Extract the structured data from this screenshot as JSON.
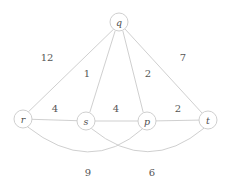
{
  "figure": {
    "kind": "weighted-undirected-graph",
    "background_color": "#ffffff",
    "edge_color": "#c9c9c9",
    "node_fill": "#ffffff",
    "node_stroke": "#c9c9c9",
    "label_color": "#4d4d4d"
  },
  "nodes": [
    {
      "id": "q",
      "label": "q",
      "x": 119,
      "y": 22,
      "r": 9
    },
    {
      "id": "r",
      "label": "r",
      "x": 23,
      "y": 119,
      "r": 9
    },
    {
      "id": "s",
      "label": "s",
      "x": 86,
      "y": 121,
      "r": 9
    },
    {
      "id": "p",
      "label": "p",
      "x": 147,
      "y": 121,
      "r": 9
    },
    {
      "id": "t",
      "label": "t",
      "x": 208,
      "y": 120,
      "r": 9
    }
  ],
  "edges": [
    {
      "id": "q-r",
      "from": "q",
      "to": "r",
      "weight": "12",
      "shape": "straight",
      "label_x": 47,
      "label_y": 57
    },
    {
      "id": "q-s",
      "from": "q",
      "to": "s",
      "weight": "1",
      "shape": "straight",
      "label_x": 87,
      "label_y": 73
    },
    {
      "id": "q-p",
      "from": "q",
      "to": "p",
      "weight": "2",
      "shape": "straight",
      "label_x": 148,
      "label_y": 73
    },
    {
      "id": "q-t",
      "from": "q",
      "to": "t",
      "weight": "7",
      "shape": "straight",
      "label_x": 183,
      "label_y": 57
    },
    {
      "id": "r-s",
      "from": "r",
      "to": "s",
      "weight": "4",
      "shape": "straight",
      "label_x": 55,
      "label_y": 108
    },
    {
      "id": "s-p",
      "from": "s",
      "to": "p",
      "weight": "4",
      "shape": "straight",
      "label_x": 116,
      "label_y": 108
    },
    {
      "id": "p-t",
      "from": "p",
      "to": "t",
      "weight": "2",
      "shape": "straight",
      "label_x": 178,
      "label_y": 108
    },
    {
      "id": "r-p",
      "from": "r",
      "to": "p",
      "weight": "9",
      "shape": "curved",
      "label_x": 88,
      "label_y": 172
    },
    {
      "id": "s-t",
      "from": "s",
      "to": "t",
      "weight": "6",
      "shape": "curved",
      "label_x": 152,
      "label_y": 172
    }
  ],
  "edge_paths": {
    "q-r": "M 113.6 29.2 L 28.4 111.8",
    "q-s": "M 115.2 30.7 L 89.8 112.3",
    "q-p": "M 122.8 30.7 L 143.2 112.3",
    "q-t": "M 124.9 28.9 L 202.1 113.1",
    "r-s": "M 32 119.3 L 77 120.7",
    "s-p": "M 95 121 L 138 121",
    "p-t": "M 156 120.9 L 199 120.1",
    "r-p": "M 27.5 126.8 Q 90 176 142.5 128.8",
    "s-t": "M 91.5 128.6 Q 148 175 204 128.2"
  }
}
